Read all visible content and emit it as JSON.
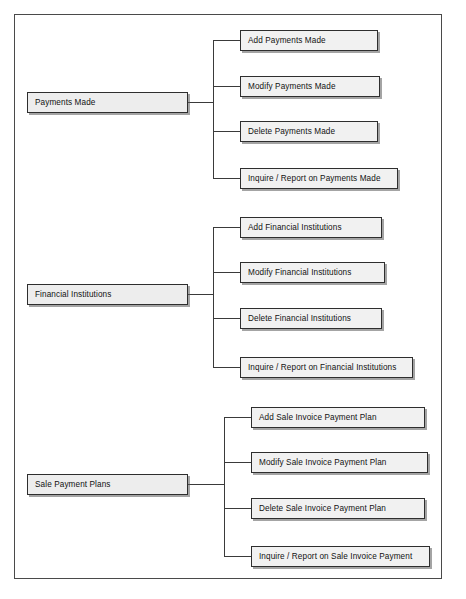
{
  "diagram": {
    "frame": {
      "visible": true,
      "border_color": "#4a4a4a"
    },
    "style": {
      "box_fill": "#eeeeee",
      "box_border": "#2e2e2e",
      "shadow_color": "#5a5a5a",
      "line_color": "#3a3a3a",
      "text_color": "#111111"
    },
    "groups": [
      {
        "id": "payments-made",
        "parent": {
          "label": "Payments Made",
          "x": 27,
          "y": 92,
          "w": 161,
          "h": 21
        },
        "trunk_x": 213,
        "children": [
          {
            "label": "Add Payments Made",
            "x": 240,
            "y": 30,
            "w": 138,
            "h": 21
          },
          {
            "label": "Modify Payments Made",
            "x": 240,
            "y": 76,
            "w": 140,
            "h": 21
          },
          {
            "label": "Delete Payments Made",
            "x": 240,
            "y": 121,
            "w": 138,
            "h": 21
          },
          {
            "label": "Inquire / Report on Payments Made",
            "x": 240,
            "y": 168,
            "w": 158,
            "h": 21
          }
        ]
      },
      {
        "id": "financial-institutions",
        "parent": {
          "label": "Financial Institutions",
          "x": 27,
          "y": 284,
          "w": 161,
          "h": 21
        },
        "trunk_x": 213,
        "children": [
          {
            "label": "Add Financial Institutions",
            "x": 240,
            "y": 217,
            "w": 142,
            "h": 21
          },
          {
            "label": "Modify Financial Institutions",
            "x": 240,
            "y": 262,
            "w": 145,
            "h": 21
          },
          {
            "label": "Delete Financial Institutions",
            "x": 240,
            "y": 308,
            "w": 142,
            "h": 21
          },
          {
            "label": "Inquire / Report on Financial Institutions",
            "x": 240,
            "y": 357,
            "w": 173,
            "h": 21
          }
        ]
      },
      {
        "id": "sale-payment-plans",
        "parent": {
          "label": "Sale Payment Plans",
          "x": 27,
          "y": 474,
          "w": 161,
          "h": 21
        },
        "trunk_x": 224,
        "children": [
          {
            "label": "Add Sale Invoice Payment Plan",
            "x": 251,
            "y": 407,
            "w": 174,
            "h": 21
          },
          {
            "label": "Modify Sale Invoice Payment Plan",
            "x": 251,
            "y": 452,
            "w": 177,
            "h": 21
          },
          {
            "label": "Delete Sale Invoice Payment Plan",
            "x": 251,
            "y": 498,
            "w": 174,
            "h": 21
          },
          {
            "label": "Inquire / Report on Sale Invoice Payment",
            "x": 251,
            "y": 546,
            "w": 179,
            "h": 21
          }
        ]
      }
    ]
  }
}
